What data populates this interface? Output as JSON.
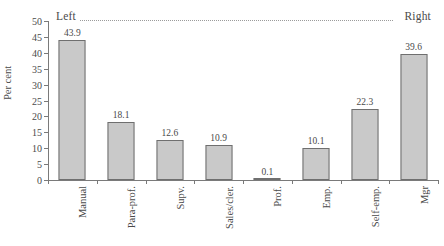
{
  "chart_data": {
    "type": "bar",
    "title": "",
    "subtitle": "",
    "xlabel": "",
    "ylabel": "Per cent",
    "ylim": [
      0,
      50
    ],
    "yticks": [
      0,
      5,
      10,
      15,
      20,
      25,
      30,
      35,
      40,
      45,
      50
    ],
    "grid": false,
    "legend": "none",
    "categories": [
      "Manual",
      "Para-prof.",
      "Supv.",
      "Sales/cler.",
      "Prof.",
      "Emp.",
      "Self-emp.",
      "Mgr"
    ],
    "values": [
      43.9,
      18.1,
      12.6,
      10.9,
      0.1,
      10.1,
      22.3,
      39.6
    ],
    "value_labels": [
      "43.9",
      "18.1",
      "12.6",
      "10.9",
      "0.1",
      "10.1",
      "22.3",
      "39.6"
    ],
    "annotations": [
      {
        "text": "Left",
        "position": "top-left"
      },
      {
        "text": "Right",
        "position": "top-right"
      }
    ],
    "colors": {
      "bar_fill": "#c9c9c9",
      "bar_border": "#6f6f6f",
      "axis": "#7a7a7a",
      "text": "#4a4a4a",
      "dotted_line": "#9b9b9b",
      "background": "#ffffff"
    }
  }
}
